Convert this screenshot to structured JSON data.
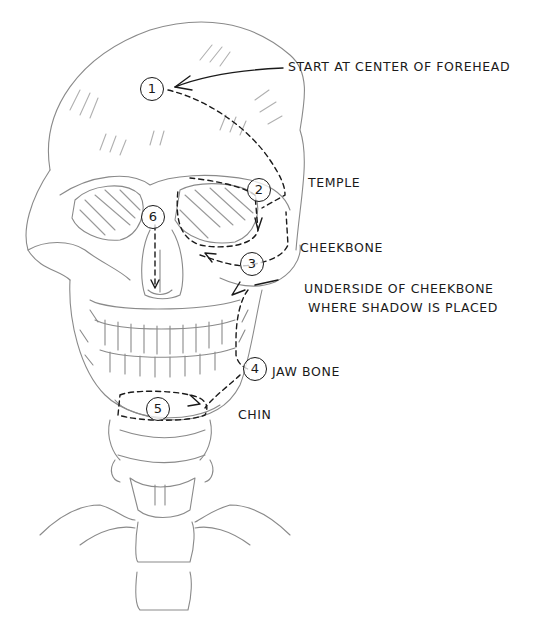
{
  "diagram": {
    "colors": {
      "sketch": "#8a8a8a",
      "ink": "#1a1a1a",
      "background": "#ffffff"
    },
    "labels": {
      "start": "START AT CENTER OF FOREHEAD",
      "temple": "TEMPLE",
      "cheekbone": "CHEEKBONE",
      "underside_line1": "UNDERSIDE OF CHEEKBONE",
      "underside_line2": "WHERE SHADOW IS PLACED",
      "jaw": "JAW BONE",
      "chin": "CHIN"
    },
    "steps": [
      {
        "n": "1",
        "name": "center of forehead"
      },
      {
        "n": "2",
        "name": "temple"
      },
      {
        "n": "3",
        "name": "cheekbone"
      },
      {
        "n": "4",
        "name": "jaw bone"
      },
      {
        "n": "5",
        "name": "chin"
      },
      {
        "n": "6",
        "name": "nose bridge"
      }
    ]
  }
}
